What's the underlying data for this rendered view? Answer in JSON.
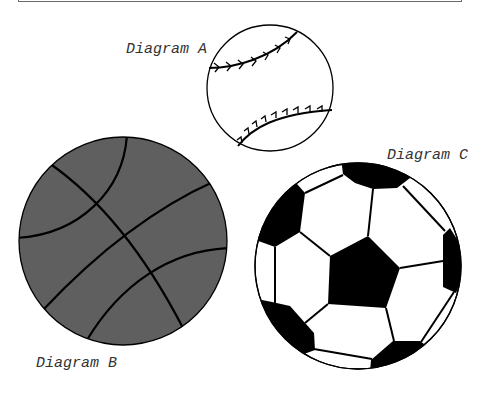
{
  "diagrams": [
    {
      "id": "A",
      "label": "Diagram A",
      "object": "baseball",
      "fill": "#ffffff"
    },
    {
      "id": "B",
      "label": "Diagram B",
      "object": "basketball",
      "fill": "#5f5f5f"
    },
    {
      "id": "C",
      "label": "Diagram C",
      "object": "soccer-ball",
      "fill": "#ffffff",
      "patch_color": "#000000"
    }
  ],
  "colors": {
    "outline": "#000000",
    "basketball": "#5f5f5f",
    "frame": "#6a6a6a"
  }
}
